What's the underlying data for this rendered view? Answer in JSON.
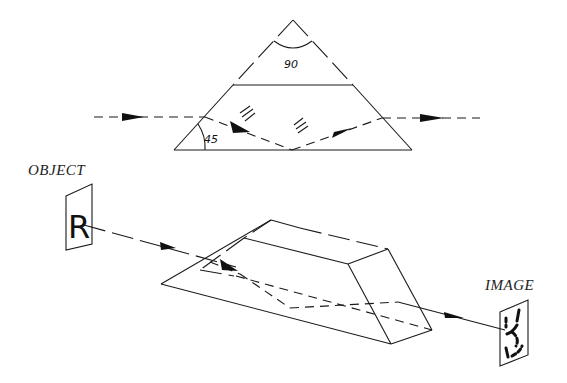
{
  "figure": {
    "cross_section": {
      "apex_angle_label": "90",
      "base_angle_label": "45"
    },
    "labels": {
      "object": "OBJECT",
      "image": "IMAGE",
      "object_letter": "R"
    },
    "colors": {
      "line": "#1a1a1a",
      "background": "#ffffff"
    }
  }
}
